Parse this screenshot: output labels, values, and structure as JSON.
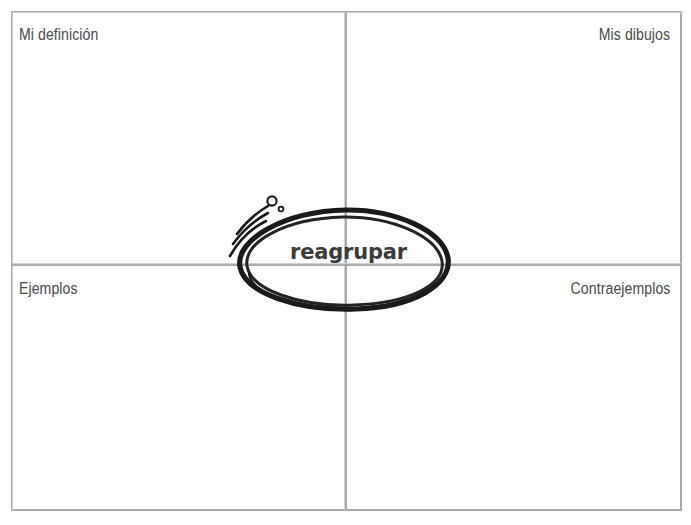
{
  "worksheet": {
    "type": "frayer-model",
    "language": "es",
    "quadrants": [
      {
        "key": "top-left",
        "label": "Mi definición"
      },
      {
        "key": "top-right",
        "label": "Mis dibujos"
      },
      {
        "key": "bottom-left",
        "label": "Ejemplos"
      },
      {
        "key": "bottom-right",
        "label": "Contraejemplos"
      }
    ],
    "center": {
      "term": "reagrupar",
      "shape": "hand-drawn-oval",
      "decorations": "motion-lines-and-bubbles"
    },
    "colors": {
      "frame": "#a9a9a9",
      "divider": "#a9a9a9",
      "label_text": "#4a4a4a",
      "term_text": "#3b3b3b",
      "oval_stroke": "#1a1a1a",
      "background": "#ffffff"
    }
  }
}
